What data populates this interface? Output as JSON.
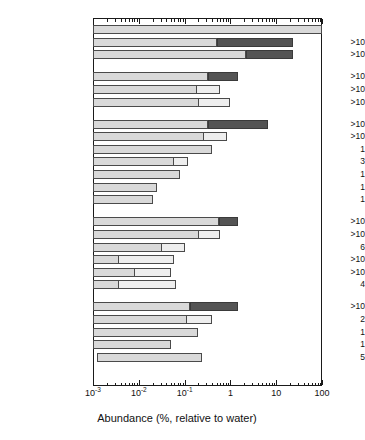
{
  "chart_data": {
    "type": "bar",
    "orientation": "horizontal",
    "title": "",
    "xlabel": "Abundance (%, relative to water)",
    "ylabel": "",
    "xscale": "log",
    "xlim": [
      0.001,
      100
    ],
    "xticks": [
      "10⁻³",
      "10⁻²",
      "10⁻¹",
      "1",
      "10",
      "100"
    ],
    "xtick_values": [
      0.001,
      0.01,
      0.1,
      1,
      10,
      100
    ],
    "grid": false,
    "legend": null,
    "count_column_header": "",
    "groups": [
      {
        "name": "water-and-oxides",
        "species": [
          {
            "label": "H_2O",
            "bold": true,
            "count": "",
            "range": [
              0.001,
              100
            ],
            "divider": null,
            "dark": null
          },
          {
            "label": "CO",
            "bold": true,
            "count": ">10",
            "range": [
              0.001,
              0.5
            ],
            "divider": null,
            "dark": [
              0.5,
              23
            ]
          },
          {
            "label": "CO_2",
            "bold": true,
            "count": ">10",
            "range": [
              0.001,
              2.2
            ],
            "divider": null,
            "dark": [
              2.2,
              23
            ]
          }
        ]
      },
      {
        "name": "hydrocarbons",
        "species": [
          {
            "label": "CH_4",
            "bold": true,
            "count": ">10",
            "range": [
              0.001,
              0.33
            ],
            "divider": null,
            "dark": [
              0.33,
              1.5
            ]
          },
          {
            "label": "C_2H_2",
            "bold": false,
            "count": ">10",
            "range": [
              0.001,
              0.6
            ],
            "divider": 0.18,
            "dark": null
          },
          {
            "label": "C_2H_6",
            "bold": false,
            "count": ">10",
            "range": [
              0.001,
              1.0
            ],
            "divider": 0.2,
            "dark": null
          }
        ]
      },
      {
        "name": "oxygenated-organics",
        "species": [
          {
            "label": "CH_3OH",
            "bold": true,
            "count": ">10",
            "range": [
              0.001,
              0.33
            ],
            "divider": null,
            "dark": [
              0.33,
              6.5
            ]
          },
          {
            "label": "H_2CO",
            "bold": false,
            "count": ">10",
            "range": [
              0.001,
              0.85
            ],
            "divider": 0.25,
            "dark": null
          },
          {
            "label": "HOCH_2CH_2OH",
            "bold": false,
            "count": "1",
            "range": [
              0.001,
              0.4
            ],
            "divider": null,
            "dark": null
          },
          {
            "label": "HCOOH",
            "bold": false,
            "count": "3",
            "range": [
              0.001,
              0.12
            ],
            "divider": 0.055,
            "dark": null
          },
          {
            "label": "HCOOCH_3",
            "bold": false,
            "count": "1",
            "range": [
              0.001,
              0.08
            ],
            "divider": null,
            "dark": null
          },
          {
            "label": "CH_3CHO",
            "bold": false,
            "count": "1",
            "range": [
              0.001,
              0.025
            ],
            "divider": null,
            "dark": null
          },
          {
            "label": "NH_2CHO",
            "bold": false,
            "count": "1",
            "range": [
              0.001,
              0.02
            ],
            "divider": null,
            "dark": null
          }
        ]
      },
      {
        "name": "nitrogen-species",
        "species": [
          {
            "label": "NH_3",
            "bold": true,
            "count": ">10",
            "range": [
              0.001,
              0.55
            ],
            "divider": null,
            "dark": [
              0.55,
              1.5
            ]
          },
          {
            "label": "HCN",
            "bold": false,
            "count": ">10",
            "range": [
              0.001,
              0.6
            ],
            "divider": 0.2,
            "dark": null
          },
          {
            "label": "HNCO",
            "bold": false,
            "count": "6",
            "range": [
              0.001,
              0.1
            ],
            "divider": 0.03,
            "dark": null
          },
          {
            "label": "HNC",
            "bold": false,
            "count": ">10",
            "range": [
              0.001,
              0.06
            ],
            "divider": 0.0035,
            "dark": null
          },
          {
            "label": "CH_3CN",
            "bold": false,
            "count": ">10",
            "range": [
              0.001,
              0.05
            ],
            "divider": 0.008,
            "dark": null
          },
          {
            "label": "HC_3N",
            "bold": false,
            "count": "4",
            "range": [
              0.001,
              0.065
            ],
            "divider": 0.0035,
            "dark": null
          }
        ]
      },
      {
        "name": "sulfur-species",
        "species": [
          {
            "label": "H_2S",
            "bold": true,
            "count": ">10",
            "range": [
              0.001,
              0.13
            ],
            "divider": null,
            "dark": [
              0.13,
              1.5
            ]
          },
          {
            "label": "OCS",
            "bold": false,
            "count": "2",
            "range": [
              0.001,
              0.4
            ],
            "divider": 0.11,
            "dark": null
          },
          {
            "label": "SO_2",
            "bold": false,
            "count": "1",
            "range": [
              0.001,
              0.2
            ],
            "divider": null,
            "dark": null
          },
          {
            "label": "H_2CS",
            "bold": false,
            "count": "1",
            "range": [
              0.001,
              0.05
            ],
            "divider": null,
            "dark": null
          },
          {
            "label": "S_2",
            "bold": false,
            "count": "5",
            "range": [
              0.0012,
              0.24
            ],
            "divider": null,
            "dark": null
          }
        ]
      }
    ]
  }
}
